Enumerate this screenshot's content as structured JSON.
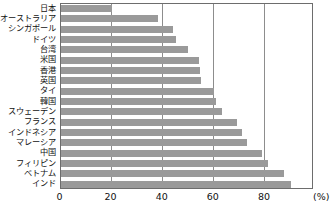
{
  "chart_data": {
    "type": "bar",
    "orientation": "horizontal",
    "title": "",
    "xlabel": "(%)",
    "ylabel": "",
    "unit": "(%)",
    "xlim": [
      0,
      99
    ],
    "xticks": [
      0,
      20,
      40,
      60,
      80
    ],
    "xtick_labels": [
      "0",
      "20",
      "40",
      "60",
      "80"
    ],
    "grid": true,
    "grid_axis": "x",
    "legend": false,
    "bar_color": "#9a9a9a",
    "axis_color": "#6d6d6d",
    "gridline_color": "#8d8d8d",
    "categories": [
      "日本",
      "オーストラリア",
      "シンガポール",
      "ドイツ",
      "台湾",
      "米国",
      "香港",
      "英国",
      "タイ",
      "韓国",
      "スウェーデン",
      "フランス",
      "インドネシア",
      "マレーシア",
      "中国",
      "フィリピン",
      "ベトナム",
      "インド"
    ],
    "values": [
      20,
      38,
      44,
      45,
      50,
      54,
      54.5,
      55,
      60,
      61,
      63,
      69,
      71,
      73,
      79,
      81,
      87.5,
      90
    ]
  }
}
